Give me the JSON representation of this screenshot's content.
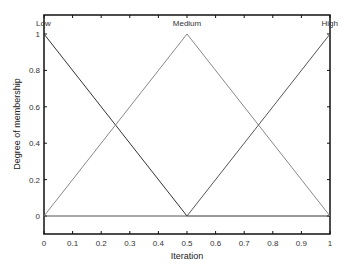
{
  "chart_data": {
    "type": "line",
    "title": "",
    "xlabel": "Iteration",
    "ylabel": "Degree of membership",
    "xlim": [
      0,
      1
    ],
    "ylim": [
      -0.1,
      1.1
    ],
    "grid": false,
    "x_ticks": [
      "0",
      "0.1",
      "0.2",
      "0.3",
      "0.4",
      "0.5",
      "0.6",
      "0.7",
      "0.8",
      "0.9",
      "1"
    ],
    "y_ticks": [
      "0",
      "0.2",
      "0.4",
      "0.6",
      "0.8",
      "1"
    ],
    "series": [
      {
        "name": "Low",
        "x": [
          0,
          0.5,
          1
        ],
        "values": [
          1,
          0,
          0
        ],
        "color": "#333333"
      },
      {
        "name": "Medium",
        "x": [
          0,
          0.5,
          1
        ],
        "values": [
          0,
          1,
          0
        ],
        "color": "#888888"
      },
      {
        "name": "High",
        "x": [
          0,
          0.5,
          1
        ],
        "values": [
          0,
          0,
          1
        ],
        "color": "#555555"
      }
    ],
    "annotations": [
      {
        "text": "Low",
        "x": 0,
        "y": 1
      },
      {
        "text": "Medium",
        "x": 0.5,
        "y": 1
      },
      {
        "text": "High",
        "x": 1,
        "y": 1
      }
    ]
  }
}
